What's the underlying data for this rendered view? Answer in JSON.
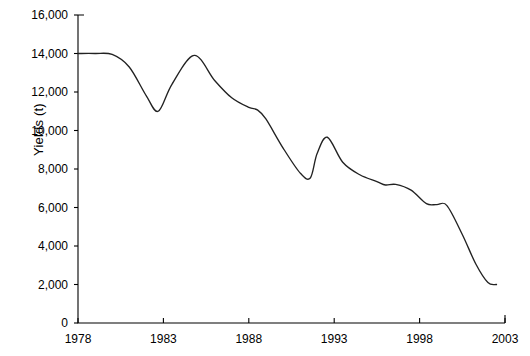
{
  "chart_data": {
    "type": "line",
    "title": "",
    "xlabel": "",
    "ylabel": "Yields (t)",
    "xlim": [
      1978,
      2003
    ],
    "ylim": [
      0,
      16000
    ],
    "grid": false,
    "legend": "none",
    "x_ticks": [
      "1978",
      "1983",
      "1988",
      "1993",
      "1998",
      "2003"
    ],
    "x_tick_values": [
      1978,
      1983,
      1988,
      1993,
      1998,
      2003
    ],
    "y_ticks": [
      "0",
      "2,000",
      "4,000",
      "6,000",
      "8,000",
      "10,000",
      "12,000",
      "14,000",
      "16,000"
    ],
    "y_tick_values": [
      0,
      2000,
      4000,
      6000,
      8000,
      10000,
      12000,
      14000,
      16000
    ],
    "series": [
      {
        "name": "Yields",
        "color": "#222222",
        "x": [
          1978,
          1979,
          1980,
          1981,
          1982,
          1982.7,
          1983.5,
          1984.8,
          1986,
          1987,
          1988,
          1988.5,
          1989,
          1990,
          1991,
          1991.6,
          1992,
          1992.6,
          1993.5,
          1994.5,
          1995.5,
          1996,
          1996.6,
          1997.5,
          1998.4,
          1999,
          1999.6,
          2000.5,
          2001.3,
          2002,
          2002.5
        ],
        "y": [
          14000,
          14000,
          13950,
          13300,
          11800,
          11000,
          12400,
          13900,
          12600,
          11700,
          11200,
          11070,
          10600,
          9100,
          7800,
          7530,
          8800,
          9650,
          8350,
          7700,
          7350,
          7170,
          7200,
          6900,
          6200,
          6150,
          6100,
          4600,
          3050,
          2100,
          2000
        ]
      }
    ]
  }
}
